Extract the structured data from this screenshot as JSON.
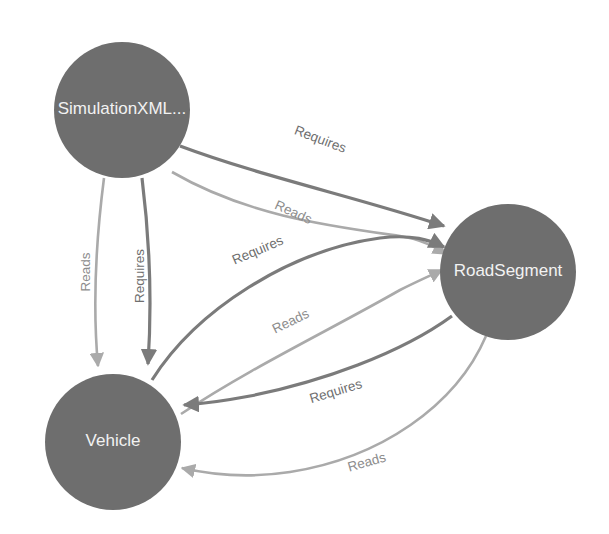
{
  "diagram": {
    "type": "directed-graph",
    "background_color": "#ffffff",
    "node_fill_color": "#6e6e6e",
    "node_label_color": "#f2f2f2",
    "edge_colors": {
      "Requires": "#7b7b7b",
      "Reads": "#aaaaaa"
    },
    "nodes": [
      {
        "id": "simulationxml",
        "label": "SimulationXML...",
        "cx": 122,
        "cy": 110,
        "r": 68
      },
      {
        "id": "roadsegment",
        "label": "RoadSegment",
        "cx": 508,
        "cy": 272,
        "r": 68
      },
      {
        "id": "vehicle",
        "label": "Vehicle",
        "cx": 113,
        "cy": 442,
        "r": 68
      }
    ],
    "edges": [
      {
        "id": "sim-road-requires",
        "source": "simulationxml",
        "target": "roadsegment",
        "label": "Requires",
        "color": "#7b7b7b",
        "width": 3.2,
        "path": "M 180,146 C 260,176 360,198 444,226",
        "label_x": 320,
        "label_y": 140,
        "label_rotate": 21,
        "label_color": "#6f6f6f"
      },
      {
        "id": "sim-road-reads",
        "source": "simulationxml",
        "target": "roadsegment",
        "label": "Reads",
        "color": "#aaaaaa",
        "width": 2.6,
        "path": "M 172,172 C 248,216 330,226 400,236 C 424,240 436,248 446,254",
        "label_x": 293,
        "label_y": 213,
        "label_rotate": 24,
        "label_color": "#8d8d8d"
      },
      {
        "id": "sim-vehicle-reads",
        "source": "simulationxml",
        "target": "vehicle",
        "label": "Reads",
        "color": "#aaaaaa",
        "width": 2.6,
        "path": "M 104,178 C 96,240 92,300 98,366",
        "label_x": 86,
        "label_y": 272,
        "label_rotate": -90,
        "label_color": "#8d8d8d"
      },
      {
        "id": "sim-vehicle-requires",
        "source": "simulationxml",
        "target": "vehicle",
        "label": "Requires",
        "color": "#7b7b7b",
        "width": 3.2,
        "path": "M 142,178 C 150,242 152,304 148,364",
        "label_x": 140,
        "label_y": 276,
        "label_rotate": -90,
        "label_color": "#6f6f6f"
      },
      {
        "id": "vehicle-road-requires",
        "source": "vehicle",
        "target": "roadsegment",
        "label": "Requires",
        "color": "#7b7b7b",
        "width": 3.2,
        "path": "M 152,380 C 196,310 290,250 380,238 C 412,234 430,240 444,247",
        "label_x": 258,
        "label_y": 251,
        "label_rotate": -23,
        "label_color": "#6f6f6f"
      },
      {
        "id": "vehicle-road-reads",
        "source": "vehicle",
        "target": "roadsegment",
        "label": "Reads",
        "color": "#aaaaaa",
        "width": 2.6,
        "path": "M 181,414 C 250,368 330,330 400,290 C 420,280 434,274 442,270",
        "label_x": 291,
        "label_y": 322,
        "label_rotate": -26,
        "label_color": "#8d8d8d"
      },
      {
        "id": "road-vehicle-requires",
        "source": "roadsegment",
        "target": "vehicle",
        "label": "Requires",
        "color": "#7b7b7b",
        "width": 3.2,
        "path": "M 452,316 C 400,354 320,382 250,396 C 218,402 200,404 184,405",
        "label_x": 336,
        "label_y": 392,
        "label_rotate": -17,
        "label_color": "#6f6f6f"
      },
      {
        "id": "road-vehicle-reads",
        "source": "roadsegment",
        "target": "vehicle",
        "label": "Reads",
        "color": "#aaaaaa",
        "width": 2.6,
        "path": "M 486,336 C 456,406 380,458 290,472 C 244,479 208,474 182,468",
        "label_x": 367,
        "label_y": 463,
        "label_rotate": -16,
        "label_color": "#8d8d8d"
      }
    ]
  }
}
